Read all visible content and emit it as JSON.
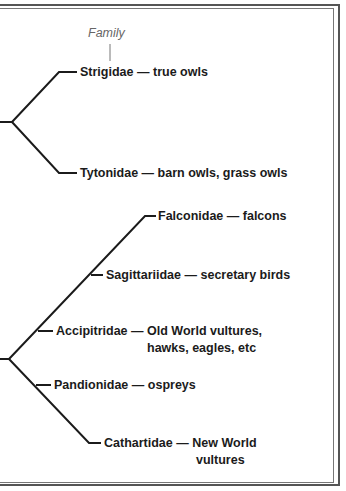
{
  "header": {
    "family_label": "Family"
  },
  "colors": {
    "line": "#1b1b1b",
    "text": "#1b1b1b",
    "header": "#666666",
    "frame": "#555555"
  },
  "groups": [
    {
      "name": "owls",
      "families": [
        {
          "family": "Strigidae",
          "dash": "—",
          "common": "true owls",
          "common2": ""
        },
        {
          "family": "Tytonidae",
          "dash": "—",
          "common": "barn owls, grass owls",
          "common2": ""
        }
      ]
    },
    {
      "name": "raptors",
      "families": [
        {
          "family": "Falconidae",
          "dash": "—",
          "common": "falcons",
          "common2": ""
        },
        {
          "family": "Sagittariidae",
          "dash": "—",
          "common": "secretary birds",
          "common2": ""
        },
        {
          "family": "Accipitridae",
          "dash": "—",
          "common": "Old World vultures,",
          "common2": "hawks, eagles, etc"
        },
        {
          "family": "Pandionidae",
          "dash": "—",
          "common": "ospreys",
          "common2": ""
        },
        {
          "family": "Cathartidae",
          "dash": "—",
          "common": "New World",
          "common2": "vultures"
        }
      ]
    }
  ]
}
